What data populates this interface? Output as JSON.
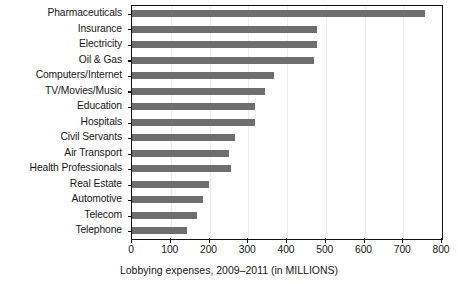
{
  "chart_data": {
    "type": "bar",
    "orientation": "horizontal",
    "title": "",
    "subtitle": "",
    "xlabel": "Lobbying expenses, 2009–2011 (in MILLIONS)",
    "ylabel": "",
    "xlim": [
      0,
      800
    ],
    "xticks": [
      0,
      100,
      200,
      300,
      400,
      500,
      600,
      700,
      800
    ],
    "xtick_labels": [
      "0",
      "100",
      "200",
      "300",
      "400",
      "500",
      "600",
      "700",
      "800"
    ],
    "grid": "light vertical gridlines at each x tick",
    "legend": null,
    "legend_position": "none",
    "bar_color": "#6e6e6e",
    "frame_color": "#111111",
    "categories": [
      "Pharmaceuticals",
      "Insurance",
      "Electricity",
      "Oil & Gas",
      "Computers/Internet",
      "TV/Movies/Music",
      "Education",
      "Hospitals",
      "Civil Servants",
      "Air Transport",
      "Health Professionals",
      "Real Estate",
      "Automotive",
      "Telecom",
      "Telephone"
    ],
    "values": [
      756,
      477,
      477,
      470,
      366,
      343,
      317,
      317,
      266,
      250,
      256,
      199,
      183,
      168,
      143
    ],
    "annotations": []
  },
  "caption": {
    "text": "Lobbying expenses, 2009–2011 (in MILLIONS)"
  }
}
